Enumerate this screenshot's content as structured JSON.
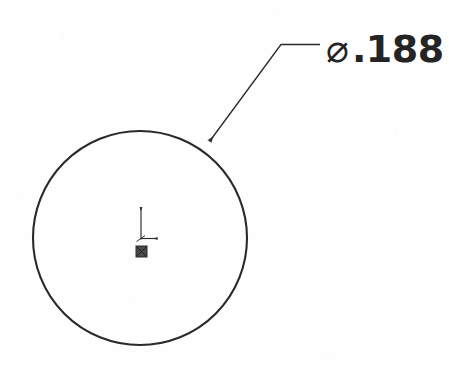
{
  "sheet": {
    "title": "Hole Diameter Detail View",
    "background_color": "#fefefe",
    "line_color": "#2a2a2a",
    "text_color": "#242424",
    "width_px": 449,
    "height_px": 383
  },
  "dimension": {
    "symbol": "⌀",
    "symbol_name": "diameter-symbol",
    "value": ".188",
    "full_text": "⌀.188",
    "type": "diameter"
  },
  "circle": {
    "name": "hole-circle",
    "center_x": 140,
    "center_y": 238,
    "radius": 107,
    "stroke_width": 2.1
  },
  "leader": {
    "name": "leader-line",
    "arrow_tip_x": 209,
    "arrow_tip_y": 142,
    "knee_x": 281,
    "knee_y": 44,
    "shelf_end_x": 320,
    "shelf_end_y": 44,
    "stroke_width": 1.3
  },
  "origin_marker": {
    "name": "origin-axis-marker",
    "origin_x": 141,
    "origin_y": 238,
    "y_axis_tip_y": 206,
    "x_axis_tip_x": 158,
    "square_x": 136,
    "square_y": 246,
    "square_size": 11,
    "stroke_width": 1.1
  }
}
